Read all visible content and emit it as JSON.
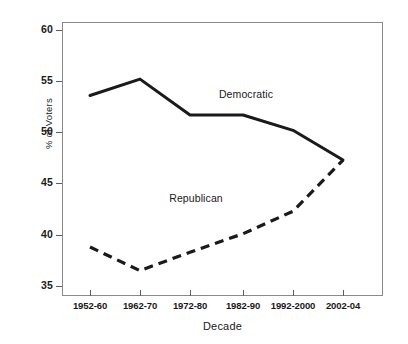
{
  "chart_data": {
    "type": "line",
    "title": "",
    "xlabel": "Decade",
    "ylabel": "% of Voters",
    "categories": [
      "1952-60",
      "1962-70",
      "1972-80",
      "1982-90",
      "1992-2000",
      "2002-04"
    ],
    "ylim": [
      35,
      60
    ],
    "yticks": [
      35,
      40,
      45,
      50,
      55,
      60
    ],
    "grid": false,
    "legend_position": "inline-annotations",
    "series": [
      {
        "name": "Democratic",
        "style": "solid",
        "color": "#1a1a1a",
        "values": [
          53.7,
          55.3,
          51.8,
          51.8,
          50.3,
          47.4
        ]
      },
      {
        "name": "Republican",
        "style": "dashed",
        "color": "#1a1a1a",
        "values": [
          38.9,
          36.6,
          38.4,
          40.2,
          42.4,
          47.4
        ]
      }
    ],
    "annotations": [
      {
        "text": "Democratic",
        "series": "Democratic"
      },
      {
        "text": "Republican",
        "series": "Republican"
      }
    ]
  },
  "axes": {
    "y_title": "% of Voters",
    "x_title": "Decade",
    "y_tick_labels": [
      "60",
      "55",
      "50",
      "45",
      "40",
      "35"
    ],
    "x_tick_labels": [
      "1952-60",
      "1962-70",
      "1972-80",
      "1982-90",
      "1992-2000",
      "2002-04"
    ]
  },
  "labels": {
    "democratic": "Democratic",
    "republican": "Republican"
  }
}
